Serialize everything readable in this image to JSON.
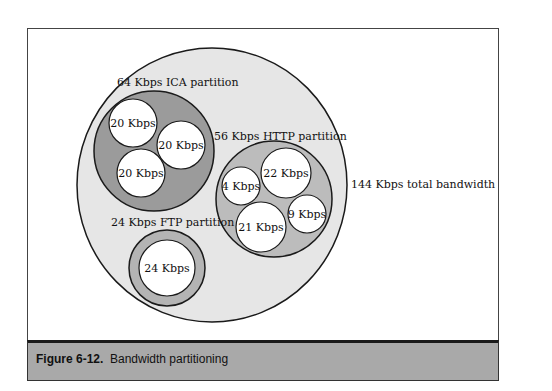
{
  "figure": {
    "number": "Figure 6-12.",
    "caption": "Bandwidth partitioning"
  },
  "colors": {
    "total_fill": "#e6e6e6",
    "ica_fill": "#9b9b9b",
    "http_fill": "#bcbcbc",
    "ftp_fill": "#b4b4b4",
    "flow_fill": "#ffffff",
    "stroke": "#1a1a1a",
    "caption_band": "#a9a9a9"
  },
  "diagram": {
    "total": {
      "label": "144 Kbps total bandwidth",
      "value_kbps": 144
    },
    "partitions": [
      {
        "id": "ica",
        "label": "64 Kbps ICA partition",
        "value_kbps": 64,
        "flows": [
          {
            "label": "20 Kbps",
            "value_kbps": 20
          },
          {
            "label": "20 Kbps",
            "value_kbps": 20
          },
          {
            "label": "20 Kbps",
            "value_kbps": 20
          }
        ]
      },
      {
        "id": "http",
        "label": "56 Kbps HTTP partition",
        "value_kbps": 56,
        "flows": [
          {
            "label": "4 Kbps",
            "value_kbps": 4
          },
          {
            "label": "22 Kbps",
            "value_kbps": 22
          },
          {
            "label": "9 Kbps",
            "value_kbps": 9
          },
          {
            "label": "21 Kbps",
            "value_kbps": 21
          }
        ]
      },
      {
        "id": "ftp",
        "label": "24 Kbps FTP partition",
        "value_kbps": 24,
        "flows": [
          {
            "label": "24 Kbps",
            "value_kbps": 24
          }
        ]
      }
    ]
  }
}
